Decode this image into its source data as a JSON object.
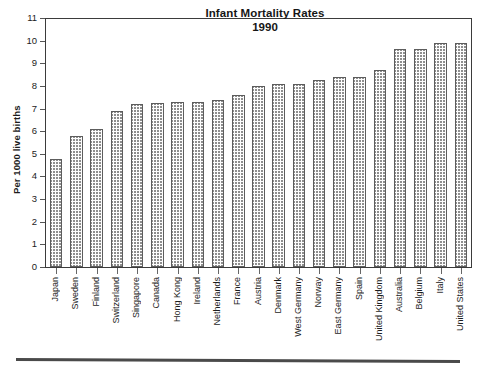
{
  "chart_data": {
    "type": "bar",
    "title": "Infant Mortality Rates",
    "subtitle": "1990",
    "xlabel": "",
    "ylabel": "Per 1000 live births",
    "ylim": [
      0,
      11
    ],
    "ytick_values": [
      0,
      1,
      2,
      3,
      4,
      5,
      6,
      7,
      8,
      9,
      10,
      11
    ],
    "ytick_labels": [
      "0",
      "1",
      "2",
      "3",
      "4",
      "5",
      "6",
      "7",
      "8",
      "9",
      "10",
      "11"
    ],
    "grid": false,
    "legend": null,
    "bar_fill": "checkerboard-hatch",
    "categories": [
      "Japan",
      "Sweden",
      "Finland",
      "Switzerland",
      "Singapore",
      "Canada",
      "Hong Kong",
      "Ireland",
      "Netherlands",
      "France",
      "Austria",
      "Denmark",
      "West Germany",
      "Norway",
      "East Germany",
      "Spain",
      "United Kingdom",
      "Australia",
      "Belgium",
      "Italy",
      "United States"
    ],
    "values": [
      4.75,
      5.8,
      6.1,
      6.9,
      7.2,
      7.25,
      7.3,
      7.3,
      7.4,
      7.6,
      8.0,
      8.1,
      8.1,
      8.25,
      8.4,
      8.4,
      8.7,
      9.65,
      9.65,
      9.9,
      9.9
    ]
  },
  "colors": {
    "axis": "#3b3b3b",
    "text": "#1c1c1c",
    "bar_edge": "#5d5d5d",
    "bar_hatch": "#8e8e8e",
    "bar_fill": "#fdfdfd",
    "rule": "#4a4a4a",
    "background": "#ffffff"
  }
}
